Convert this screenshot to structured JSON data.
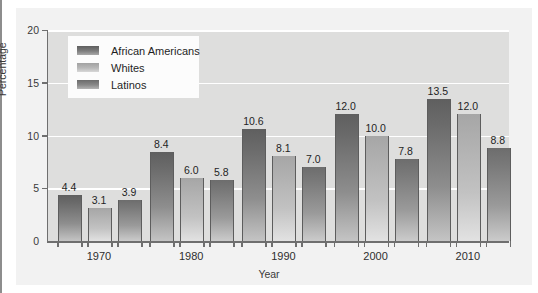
{
  "chart_data": {
    "type": "bar",
    "title": "",
    "xlabel": "Year",
    "ylabel": "Percentage",
    "categories": [
      "1970",
      "1980",
      "1990",
      "2000",
      "2010"
    ],
    "series": [
      {
        "name": "African Americans",
        "color": "#6b6b6b",
        "values": [
          4.4,
          8.4,
          10.6,
          12.0,
          13.5
        ]
      },
      {
        "name": "Whites",
        "color": "#b4b4b4",
        "values": [
          3.1,
          6.0,
          8.1,
          10.0,
          12.0
        ]
      },
      {
        "name": "Latinos",
        "color": "#808080",
        "values": [
          3.9,
          5.8,
          7.0,
          7.8,
          8.8
        ]
      }
    ],
    "ylim": [
      0,
      20
    ],
    "yticks": [
      "0",
      "5",
      "10",
      "15",
      "20"
    ],
    "ytick_values": [
      0,
      5,
      10,
      15,
      20
    ],
    "grid": true,
    "legend_position": "top-left",
    "plot_background": "#dededd",
    "gridline_color": "#ffffff",
    "axis_color": "#6f6f6f",
    "figure_background": "#f2f2f2"
  }
}
